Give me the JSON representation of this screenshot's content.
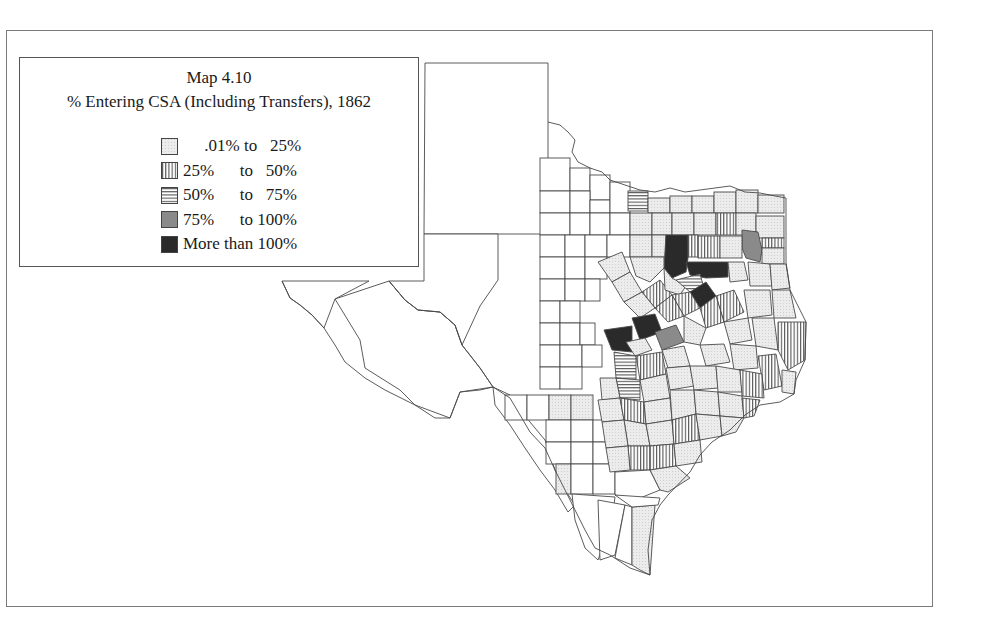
{
  "figure": {
    "title": "Map 4.10",
    "subtitle": "% Entering CSA (Including Transfers), 1862"
  },
  "legend": {
    "items": [
      {
        "key": "c1",
        "label": "     .01% to   25%",
        "pattern": "light-stipple",
        "color": "#e4e4e4"
      },
      {
        "key": "c2",
        "label": "25%      to   50%",
        "pattern": "vertical-lines",
        "color": "#ffffff"
      },
      {
        "key": "c3",
        "label": "50%      to   75%",
        "pattern": "horizontal-lines",
        "color": "#ffffff"
      },
      {
        "key": "c4",
        "label": "75%      to 100%",
        "pattern": "medium-gray",
        "color": "#8a8a8a"
      },
      {
        "key": "c5",
        "label": "More than 100%",
        "pattern": "dark",
        "color": "#2a2a2a"
      }
    ]
  },
  "map": {
    "region": "Texas counties",
    "year": "1862"
  }
}
